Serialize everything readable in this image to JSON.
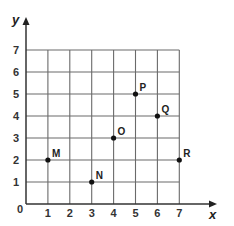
{
  "chart_data": {
    "type": "scatter",
    "title": "",
    "xlabel": "x",
    "ylabel": "y",
    "xlim": [
      0,
      7
    ],
    "ylim": [
      0,
      7
    ],
    "grid": true,
    "x_ticks": [
      "1",
      "2",
      "3",
      "4",
      "5",
      "6",
      "7"
    ],
    "y_ticks": [
      "1",
      "2",
      "3",
      "4",
      "5",
      "6",
      "7"
    ],
    "origin_label": "0",
    "points": [
      {
        "label": "M",
        "x": 1,
        "y": 2
      },
      {
        "label": "N",
        "x": 3,
        "y": 1
      },
      {
        "label": "O",
        "x": 4,
        "y": 3
      },
      {
        "label": "P",
        "x": 5,
        "y": 5
      },
      {
        "label": "Q",
        "x": 6,
        "y": 4
      },
      {
        "label": "R",
        "x": 7,
        "y": 2
      }
    ],
    "colors": {
      "grid": "#6a6a6a",
      "axis": "#333333",
      "point": "#111111"
    }
  }
}
